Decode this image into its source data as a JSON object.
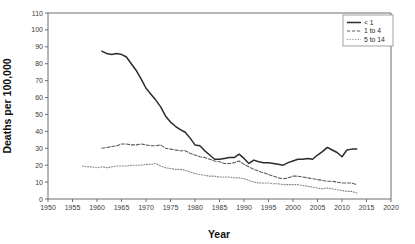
{
  "chart_data": {
    "type": "line",
    "title": "",
    "xlabel": "Year",
    "ylabel": "Deaths per 100,000",
    "xlim": [
      1950,
      2020
    ],
    "ylim": [
      0,
      110
    ],
    "xticks": [
      1950,
      1955,
      1960,
      1965,
      1970,
      1975,
      1980,
      1985,
      1990,
      1995,
      2000,
      2005,
      2010,
      2015,
      2020
    ],
    "yticks": [
      0,
      10,
      20,
      30,
      40,
      50,
      60,
      70,
      80,
      90,
      100,
      110
    ],
    "grid": false,
    "legend_position": "top-right",
    "series": [
      {
        "name": "< 1",
        "style": "solid",
        "color": "#2b2b2b",
        "x": [
          1961,
          1962,
          1963,
          1964,
          1965,
          1966,
          1967,
          1968,
          1969,
          1970,
          1971,
          1972,
          1973,
          1974,
          1975,
          1976,
          1977,
          1978,
          1979,
          1980,
          1981,
          1982,
          1983,
          1984,
          1985,
          1986,
          1987,
          1988,
          1989,
          1990,
          1991,
          1992,
          1993,
          1994,
          1995,
          1996,
          1997,
          1998,
          1999,
          2000,
          2001,
          2002,
          2003,
          2004,
          2005,
          2006,
          2007,
          2008,
          2009,
          2010,
          2011,
          2012,
          2013
        ],
        "values": [
          87.5,
          86.0,
          85.5,
          86.0,
          85.5,
          84.0,
          80.0,
          76.0,
          71.0,
          65.5,
          62.0,
          58.5,
          54.5,
          49.0,
          45.5,
          43.0,
          41.0,
          39.5,
          36.0,
          32.0,
          31.5,
          28.5,
          26.0,
          23.5,
          23.5,
          24.0,
          24.5,
          24.5,
          26.5,
          24.0,
          21.0,
          23.0,
          22.0,
          21.5,
          21.5,
          21.0,
          20.5,
          20.0,
          21.5,
          22.5,
          23.5,
          23.5,
          24.0,
          23.5,
          26.0,
          28.0,
          30.5,
          29.0,
          27.5,
          25.0,
          29.0,
          29.5,
          29.5
        ]
      },
      {
        "name": "1 to 4",
        "style": "dashed",
        "color": "#5a5a5a",
        "x": [
          1961,
          1962,
          1963,
          1964,
          1965,
          1966,
          1967,
          1968,
          1969,
          1970,
          1971,
          1972,
          1973,
          1974,
          1975,
          1976,
          1977,
          1978,
          1979,
          1980,
          1981,
          1982,
          1983,
          1984,
          1985,
          1986,
          1987,
          1988,
          1989,
          1990,
          1991,
          1992,
          1993,
          1994,
          1995,
          1996,
          1997,
          1998,
          1999,
          2000,
          2001,
          2002,
          2003,
          2004,
          2005,
          2006,
          2007,
          2008,
          2009,
          2010,
          2011,
          2012,
          2013
        ],
        "values": [
          30.0,
          30.5,
          31.0,
          31.5,
          32.5,
          32.5,
          32.0,
          32.0,
          32.5,
          32.0,
          31.5,
          31.5,
          32.0,
          30.0,
          29.5,
          29.0,
          28.5,
          28.5,
          27.0,
          26.0,
          25.0,
          24.5,
          23.5,
          22.5,
          22.0,
          21.0,
          21.0,
          21.5,
          22.5,
          20.5,
          19.0,
          17.5,
          16.5,
          15.5,
          14.5,
          13.5,
          12.5,
          12.0,
          12.5,
          13.5,
          13.5,
          13.0,
          12.5,
          12.0,
          11.5,
          11.0,
          10.5,
          10.5,
          10.0,
          9.5,
          9.5,
          9.5,
          8.5
        ]
      },
      {
        "name": "5 to 14",
        "style": "dotted",
        "color": "#8a8a8a",
        "x": [
          1957,
          1958,
          1959,
          1960,
          1961,
          1962,
          1963,
          1964,
          1965,
          1966,
          1967,
          1968,
          1969,
          1970,
          1971,
          1972,
          1973,
          1974,
          1975,
          1976,
          1977,
          1978,
          1979,
          1980,
          1981,
          1982,
          1983,
          1984,
          1985,
          1986,
          1987,
          1988,
          1989,
          1990,
          1991,
          1992,
          1993,
          1994,
          1995,
          1996,
          1997,
          1998,
          1999,
          2000,
          2001,
          2002,
          2003,
          2004,
          2005,
          2006,
          2007,
          2008,
          2009,
          2010,
          2011,
          2012,
          2013
        ],
        "values": [
          19.5,
          19.0,
          19.0,
          18.5,
          19.0,
          18.5,
          19.0,
          19.5,
          19.5,
          19.5,
          20.0,
          20.0,
          20.0,
          20.5,
          20.5,
          21.0,
          19.5,
          18.5,
          18.0,
          17.5,
          17.5,
          17.0,
          16.0,
          15.0,
          14.5,
          14.0,
          13.5,
          13.5,
          13.0,
          13.0,
          13.0,
          12.5,
          12.5,
          12.0,
          11.0,
          10.0,
          9.5,
          9.5,
          9.5,
          9.0,
          9.0,
          8.5,
          8.5,
          8.5,
          8.5,
          8.0,
          7.5,
          7.0,
          6.5,
          6.0,
          6.5,
          6.0,
          5.5,
          5.0,
          4.5,
          4.5,
          3.5
        ]
      }
    ]
  },
  "legend": {
    "entries": [
      {
        "label": "< 1"
      },
      {
        "label": "1 to 4"
      },
      {
        "label": "5 to 14"
      }
    ]
  }
}
